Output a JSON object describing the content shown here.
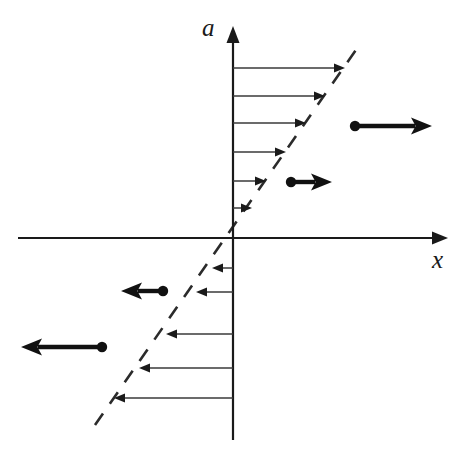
{
  "figure": {
    "background_color": "#ffffff",
    "width": 466,
    "height": 464
  },
  "axes": {
    "vertical": {
      "label": "a",
      "label_x": 202,
      "label_y": 36,
      "x": 233,
      "y_top": 26,
      "y_bottom": 440,
      "has_arrowhead": true,
      "arrow_direction": "up",
      "color": "#1a1a1a"
    },
    "horizontal": {
      "label": "x",
      "label_x": 432,
      "label_y": 268,
      "y": 238,
      "x_left": 18,
      "x_right": 448,
      "has_arrowhead": true,
      "arrow_direction": "right",
      "color": "#1a1a1a"
    },
    "origin": {
      "x": 233,
      "y": 238
    }
  },
  "nullcline": {
    "name": "dashed-diagonal-line",
    "style": "dashed",
    "dash_length": 14,
    "gap_length": 12,
    "color": "#2b2b2b",
    "x1": 95,
    "y1": 425,
    "x2": 360,
    "y2": 44,
    "passes_through_origin": true,
    "slope_sign": "positive"
  },
  "chart_data": {
    "type": "scatter",
    "xlabel": "x",
    "ylabel": "a",
    "grid": false,
    "legend": null,
    "annotations": [
      "dashed diagonal nullcline through origin",
      "thin horizontal arrows from vertical axis toward nullcline",
      "bold arrows with tail dots showing motion away from nullcline"
    ]
  },
  "flow_arrows": {
    "upper_right_group": {
      "description": "Thin arrows pointing right from the a-axis to the dashed line",
      "direction": "right",
      "count": 6,
      "arrows": [
        {
          "x_start": 233,
          "x_end": 345,
          "y": 68
        },
        {
          "x_start": 233,
          "x_end": 325,
          "y": 96
        },
        {
          "x_start": 233,
          "x_end": 306,
          "y": 123
        },
        {
          "x_start": 233,
          "x_end": 286,
          "y": 152
        },
        {
          "x_start": 233,
          "x_end": 266,
          "y": 181
        },
        {
          "x_start": 233,
          "x_end": 252,
          "y": 208
        }
      ]
    },
    "lower_left_group": {
      "description": "Thin arrows pointing left from the a-axis to the dashed line",
      "direction": "left",
      "count": 5,
      "arrows": [
        {
          "x_start": 233,
          "x_end": 212,
          "y": 268
        },
        {
          "x_start": 233,
          "x_end": 196,
          "y": 292
        },
        {
          "x_start": 233,
          "x_end": 166,
          "y": 334
        },
        {
          "x_start": 233,
          "x_end": 139,
          "y": 368
        },
        {
          "x_start": 233,
          "x_end": 114,
          "y": 398
        }
      ]
    }
  },
  "bold_arrows": [
    {
      "name": "bold-arrow-upper-right",
      "direction": "right",
      "dot_x": 355,
      "dot_y": 126,
      "tip_x": 432,
      "tip_y": 126
    },
    {
      "name": "bold-arrow-middle-right",
      "direction": "right",
      "dot_x": 291,
      "dot_y": 182,
      "tip_x": 332,
      "tip_y": 182
    },
    {
      "name": "bold-arrow-middle-left",
      "direction": "left",
      "dot_x": 163,
      "dot_y": 291,
      "tip_x": 121,
      "tip_y": 291
    },
    {
      "name": "bold-arrow-lower-left",
      "direction": "left",
      "dot_x": 102,
      "dot_y": 347,
      "tip_x": 21,
      "tip_y": 347
    }
  ]
}
